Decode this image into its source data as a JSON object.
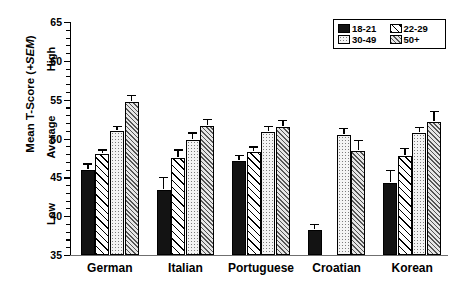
{
  "chart_data": {
    "type": "bar",
    "title": "",
    "xlabel": "",
    "ylabel": "Mean T-Score (+SEM)",
    "ylim": [
      35,
      65
    ],
    "ytick_step": 5,
    "yticks": [
      35,
      40,
      45,
      50,
      55,
      60,
      65
    ],
    "ytick_labels": [
      "35",
      "40",
      "45",
      "50",
      "55",
      "60",
      "65"
    ],
    "y_anchor_labels": [
      {
        "text": "Low",
        "value": 40
      },
      {
        "text": "Average",
        "value": 50
      },
      {
        "text": "High",
        "value": 60
      }
    ],
    "grid": false,
    "legend_position": "top-right",
    "categories": [
      "German",
      "Italian",
      "Portuguese",
      "Croatian",
      "Korean"
    ],
    "series": [
      {
        "name": "18-21",
        "fill": "solid-black",
        "color": "#131313",
        "values": [
          46.0,
          43.4,
          47.1,
          38.2,
          44.3
        ],
        "errors": [
          0.5,
          1.4,
          0.5,
          0.5,
          1.4
        ]
      },
      {
        "name": "22-29",
        "fill": "diagonal-lines",
        "color": "#ffffff",
        "values": [
          48.0,
          47.5,
          48.3,
          null,
          47.8
        ],
        "errors": [
          0.3,
          0.8,
          0.4,
          null,
          0.7
        ]
      },
      {
        "name": "30-49",
        "fill": "dotted-stipple",
        "color": "#f4f4f4",
        "values": [
          51.0,
          49.8,
          50.8,
          50.5,
          50.7
        ],
        "errors": [
          0.3,
          0.7,
          0.5,
          0.6,
          0.5
        ]
      },
      {
        "name": "50+",
        "fill": "dense-diagonal-hatch",
        "color": "#e6e6e6",
        "values": [
          54.7,
          51.6,
          51.5,
          48.4,
          52.1
        ],
        "errors": [
          0.6,
          0.6,
          0.6,
          1.1,
          1.2
        ]
      }
    ]
  },
  "legend": {
    "entries": [
      {
        "label": "18-21",
        "swatch": "solid-black-swatch"
      },
      {
        "label": "22-29",
        "swatch": "diagonal-lines-swatch"
      },
      {
        "label": "30-49",
        "swatch": "dotted-stipple-swatch"
      },
      {
        "label": "50+",
        "swatch": "dense-hatch-swatch"
      }
    ]
  },
  "axis": {
    "y_title_main": "Mean T-Score (",
    "y_title_italic": "+SEM",
    "y_title_tail": ")"
  }
}
